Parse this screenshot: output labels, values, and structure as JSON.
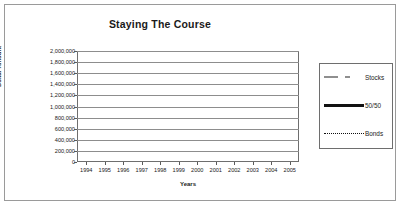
{
  "chart_data": {
    "type": "line",
    "title": "Staying The Course",
    "xlabel": "Years",
    "ylabel": "Dollar Amount",
    "categories": [
      "1994",
      "1995",
      "1996",
      "1997",
      "1998",
      "1999",
      "2000",
      "2001",
      "2002",
      "2003",
      "2004",
      "2005"
    ],
    "ylim": [
      0,
      2000000
    ],
    "yticks": [
      0,
      200000,
      400000,
      600000,
      800000,
      1000000,
      1200000,
      1400000,
      1600000,
      1800000,
      2000000
    ],
    "ytick_labels": [
      "0",
      "200,000",
      "400,000",
      "600,000",
      "800,000",
      "1,000,000",
      "1,200,000",
      "1,400,000",
      "1,600,000",
      "1,800,000",
      "2,000,000"
    ],
    "grid": true,
    "legend_position": "right",
    "series": [
      {
        "name": "Stocks",
        "style": "dashed",
        "color": "#8f8f8f",
        "values": [
          510000,
          640000,
          690000,
          930000,
          1210000,
          1760000,
          1520000,
          1300000,
          1010000,
          1300000,
          1470000,
          1640000
        ]
      },
      {
        "name": "50/50",
        "style": "solid",
        "color": "#111111",
        "values": [
          505000,
          620000,
          670000,
          790000,
          910000,
          1010000,
          1050000,
          1045000,
          990000,
          1130000,
          1215000,
          1275000
        ]
      },
      {
        "name": "Bonds",
        "style": "dotted",
        "color": "#111111",
        "values": [
          500000,
          600000,
          645000,
          700000,
          750000,
          800000,
          860000,
          930000,
          985000,
          1100000,
          1190000,
          1245000
        ]
      }
    ]
  },
  "legend": {
    "items": [
      {
        "label": "Stocks"
      },
      {
        "label": "50/50"
      },
      {
        "label": "Bonds"
      }
    ]
  }
}
